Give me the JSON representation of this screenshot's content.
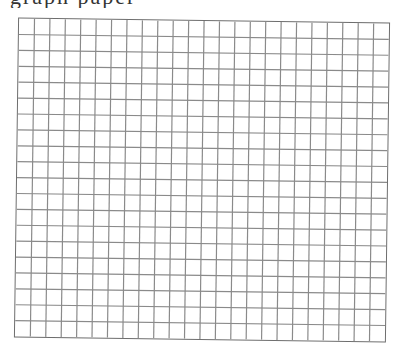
{
  "header": {
    "title_clipped": "graph paper"
  },
  "grid": {
    "columns": 24,
    "rows": 20,
    "line_color": "#8a8a8a",
    "border_color": "#6e6e6e",
    "background": "#ffffff"
  }
}
